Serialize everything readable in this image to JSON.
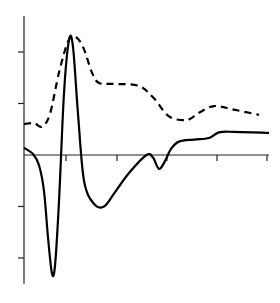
{
  "chart_data": {
    "type": "line",
    "title": "",
    "xlabel": "",
    "ylabel": "",
    "legend": [],
    "grid": false,
    "axes": {
      "x_origin_px": 24,
      "y_zero_px": 155,
      "x_px_per_unit": 50,
      "y_px_per_unit": 51.5,
      "x_ticks": [
        0.84,
        1.86,
        2.86,
        3.86,
        4.86
      ],
      "y_ticks": [
        2,
        1,
        -1,
        -2
      ],
      "ylim": [
        -2.5,
        2.7
      ],
      "xlim": [
        0,
        4.9
      ]
    },
    "series": [
      {
        "name": "solid",
        "style": "solid",
        "color": "#000000",
        "points": [
          [
            0.0,
            0.14
          ],
          [
            0.18,
            0.02
          ],
          [
            0.3,
            -0.2
          ],
          [
            0.4,
            -0.7
          ],
          [
            0.48,
            -1.6
          ],
          [
            0.56,
            -2.3
          ],
          [
            0.62,
            -2.15
          ],
          [
            0.7,
            -0.9
          ],
          [
            0.8,
            1.2
          ],
          [
            0.9,
            2.23
          ],
          [
            0.98,
            2.1
          ],
          [
            1.08,
            0.8
          ],
          [
            1.2,
            -0.5
          ],
          [
            1.4,
            -0.95
          ],
          [
            1.6,
            -1.0
          ],
          [
            1.8,
            -0.75
          ],
          [
            2.1,
            -0.35
          ],
          [
            2.45,
            0.0
          ],
          [
            2.58,
            -0.05
          ],
          [
            2.7,
            -0.27
          ],
          [
            2.82,
            -0.12
          ],
          [
            2.94,
            0.12
          ],
          [
            3.1,
            0.26
          ],
          [
            3.4,
            0.3
          ],
          [
            3.7,
            0.33
          ],
          [
            3.9,
            0.44
          ],
          [
            4.2,
            0.45
          ],
          [
            4.9,
            0.43
          ]
        ]
      },
      {
        "name": "dashed",
        "style": "dashed",
        "color": "#000000",
        "points": [
          [
            0.0,
            0.6
          ],
          [
            0.2,
            0.62
          ],
          [
            0.36,
            0.55
          ],
          [
            0.52,
            0.8
          ],
          [
            0.7,
            1.6
          ],
          [
            0.88,
            2.2
          ],
          [
            1.02,
            2.3
          ],
          [
            1.18,
            2.1
          ],
          [
            1.36,
            1.6
          ],
          [
            1.5,
            1.4
          ],
          [
            1.8,
            1.38
          ],
          [
            2.3,
            1.34
          ],
          [
            2.6,
            1.1
          ],
          [
            2.9,
            0.75
          ],
          [
            3.26,
            0.68
          ],
          [
            3.5,
            0.82
          ],
          [
            3.8,
            0.95
          ],
          [
            4.2,
            0.88
          ],
          [
            4.7,
            0.78
          ]
        ]
      }
    ]
  }
}
